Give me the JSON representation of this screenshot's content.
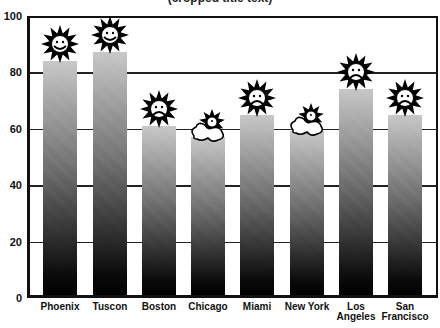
{
  "chart_data": {
    "type": "bar",
    "title": "",
    "xlabel": "",
    "ylabel": "",
    "categories": [
      "Phoenix",
      "Tuscon",
      "Boston",
      "Chicago",
      "Miami",
      "New York",
      "Los Angeles",
      "San Francisco"
    ],
    "values": [
      83,
      86,
      60,
      56,
      64,
      58,
      73,
      64
    ],
    "icons": [
      "sun-happy",
      "sun-happy",
      "sun-sad",
      "cloud-sun",
      "sun-sad",
      "cloud-sun",
      "sun-sad",
      "sun-sad"
    ],
    "ylim": [
      0,
      100
    ],
    "yticks": [
      0,
      20,
      40,
      60,
      80,
      100
    ],
    "grid": true,
    "legend": "none",
    "bar_fill": "gradient light-gray top to black bottom (dithered)"
  },
  "labels": {
    "title_partial": "(cropped title text)",
    "x": [
      "Phoenix",
      "Tuscon",
      "Boston",
      "Chicago",
      "Miami",
      "New York",
      "Los",
      "San"
    ],
    "x2": [
      "",
      "",
      "",
      "",
      "",
      "",
      "Angeles",
      "Francisco"
    ],
    "y": [
      "0",
      "20",
      "40",
      "60",
      "80",
      "100"
    ]
  }
}
